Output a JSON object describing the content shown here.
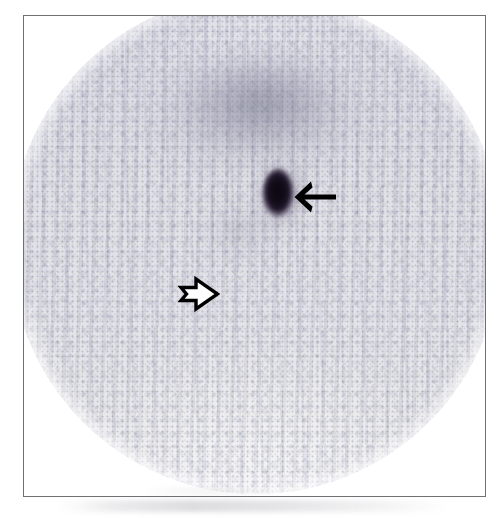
{
  "figure": {
    "modality": "planar-scintigraphy",
    "caption": "",
    "frame": {
      "border_color": "#6f6f74",
      "left": 23,
      "top": 15,
      "width": 463,
      "height": 482
    },
    "field_of_view": {
      "shape": "circular",
      "label": "circular-detector-field-of-view",
      "background_color": "#dcdce5",
      "rim_color": "#eaeaee"
    },
    "findings": [
      {
        "id": "focal-hotspot",
        "label": "intense focal radiotracer uptake",
        "color": "#0b0710",
        "halo_color": "#6e5f7d",
        "shape": "oval",
        "position": "upper-central-field"
      },
      {
        "id": "diffuse-uptake",
        "label": "diffuse band of increased background activity",
        "color": "#6e7087",
        "shape": "broad-band",
        "position": "superior-field"
      },
      {
        "id": "secondary-uptake",
        "label": "faint secondary uptake",
        "color": "#7a7c91",
        "shape": "ill-defined",
        "position": "left-mid-field"
      }
    ],
    "annotations": [
      {
        "id": "solid-arrow",
        "icon": "arrow-left-solid-icon",
        "label": "solid arrow marking focal hotspot",
        "style": "filled",
        "color": "#000000",
        "direction": "left"
      },
      {
        "id": "open-arrow",
        "icon": "arrow-right-open-icon",
        "label": "open arrow marking faint region",
        "style": "outlined",
        "color": "#000000",
        "fill": "#ffffff",
        "direction": "right"
      }
    ],
    "artifacts": [
      {
        "id": "vertical-striping",
        "label": "vertical striping artifact",
        "color": "#9696af"
      },
      {
        "id": "photon-noise",
        "label": "statistical photon noise speckle",
        "color": "#8282a0"
      },
      {
        "id": "bottom-smudge",
        "label": "scan smudge below frame",
        "color": "#8c8c96"
      }
    ]
  }
}
